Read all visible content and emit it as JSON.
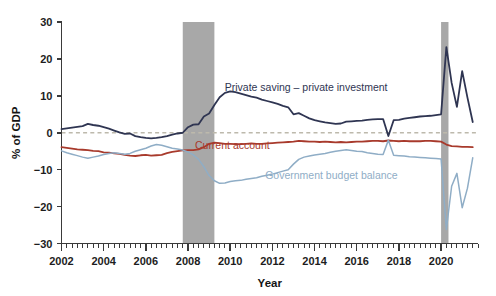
{
  "chart_data": {
    "type": "line",
    "title": "",
    "xlabel": "Year",
    "ylabel": "% of GDP",
    "xlim": [
      2002.0,
      2021.75
    ],
    "ylim": [
      -30,
      30
    ],
    "yticks": [
      -30,
      -20,
      -10,
      0,
      10,
      20,
      30
    ],
    "ytick_labels": [
      "−30",
      "−20",
      "−10",
      "0",
      "10",
      "20",
      "30"
    ],
    "xticks": [
      2002,
      2004,
      2006,
      2008,
      2010,
      2012,
      2014,
      2016,
      2018,
      2020
    ],
    "xtick_labels": [
      "2002",
      "2004",
      "2006",
      "2008",
      "2010",
      "2012",
      "2014",
      "2016",
      "2018",
      "2020"
    ],
    "minor_tick_interval": 0.25,
    "grid": false,
    "legend_position": "inline-annotations",
    "zero_reference_line": {
      "value": 0,
      "style": "dashed",
      "color": "#bdb9ac"
    },
    "shaded_regions": [
      {
        "name": "recession-2008",
        "x_start": 2007.75,
        "x_end": 2009.25,
        "color": "#a8a8a8"
      },
      {
        "name": "recession-2020",
        "x_start": 2020.0,
        "x_end": 2020.35,
        "color": "#a8a8a8"
      }
    ],
    "series": [
      {
        "name": "Private saving – private investment",
        "color": "#2f3552",
        "label_x": 2013.6,
        "label_y": 11.2,
        "x": [
          2002.0,
          2002.25,
          2002.5,
          2002.75,
          2003.0,
          2003.25,
          2003.5,
          2003.75,
          2004.0,
          2004.25,
          2004.5,
          2004.75,
          2005.0,
          2005.25,
          2005.5,
          2005.75,
          2006.0,
          2006.25,
          2006.5,
          2006.75,
          2007.0,
          2007.25,
          2007.5,
          2007.75,
          2008.0,
          2008.25,
          2008.5,
          2008.75,
          2009.0,
          2009.25,
          2009.5,
          2009.75,
          2010.0,
          2010.25,
          2010.5,
          2010.75,
          2011.0,
          2011.25,
          2011.5,
          2011.75,
          2012.0,
          2012.25,
          2012.5,
          2012.75,
          2013.0,
          2013.25,
          2013.5,
          2013.75,
          2014.0,
          2014.25,
          2014.5,
          2014.75,
          2015.0,
          2015.25,
          2015.5,
          2015.75,
          2016.0,
          2016.25,
          2016.5,
          2016.75,
          2017.0,
          2017.25,
          2017.5,
          2017.75,
          2018.0,
          2018.25,
          2018.5,
          2018.75,
          2019.0,
          2019.25,
          2019.5,
          2019.75,
          2020.0,
          2020.25,
          2020.5,
          2020.75,
          2021.0,
          2021.25,
          2021.5
        ],
        "y": [
          1.0,
          1.2,
          1.4,
          1.6,
          1.8,
          2.4,
          2.1,
          1.9,
          1.5,
          1.1,
          0.6,
          0.1,
          -0.3,
          -0.2,
          -0.9,
          -1.2,
          -1.4,
          -1.5,
          -1.4,
          -1.2,
          -0.9,
          -0.5,
          -0.2,
          0.0,
          1.5,
          2.2,
          2.3,
          4.4,
          5.2,
          7.5,
          9.6,
          10.8,
          11.2,
          11.0,
          10.6,
          10.2,
          9.8,
          9.5,
          9.0,
          8.6,
          8.2,
          7.8,
          7.3,
          6.9,
          5.0,
          5.3,
          4.6,
          3.9,
          3.4,
          3.1,
          2.8,
          2.6,
          2.4,
          2.5,
          3.0,
          3.1,
          3.2,
          3.3,
          3.5,
          3.6,
          3.7,
          3.7,
          -0.9,
          3.4,
          3.5,
          3.8,
          4.0,
          4.2,
          4.4,
          4.5,
          4.6,
          4.8,
          5.0,
          23.2,
          13.5,
          7.0,
          16.7,
          9.5,
          2.9
        ]
      },
      {
        "name": "Current account",
        "color": "#a83a2c",
        "label_x": 2010.1,
        "label_y": -4.5,
        "x": [
          2002.0,
          2002.25,
          2002.5,
          2002.75,
          2003.0,
          2003.25,
          2003.5,
          2003.75,
          2004.0,
          2004.25,
          2004.5,
          2004.75,
          2005.0,
          2005.25,
          2005.5,
          2005.75,
          2006.0,
          2006.25,
          2006.5,
          2006.75,
          2007.0,
          2007.25,
          2007.5,
          2007.75,
          2008.0,
          2008.25,
          2008.5,
          2008.75,
          2009.0,
          2009.25,
          2009.5,
          2009.75,
          2010.0,
          2010.25,
          2010.5,
          2010.75,
          2011.0,
          2011.25,
          2011.5,
          2011.75,
          2012.0,
          2012.25,
          2012.5,
          2012.75,
          2013.0,
          2013.25,
          2013.5,
          2013.75,
          2014.0,
          2014.25,
          2014.5,
          2014.75,
          2015.0,
          2015.25,
          2015.5,
          2015.75,
          2016.0,
          2016.25,
          2016.5,
          2016.75,
          2017.0,
          2017.25,
          2017.5,
          2017.75,
          2018.0,
          2018.25,
          2018.5,
          2018.75,
          2019.0,
          2019.25,
          2019.5,
          2019.75,
          2020.0,
          2020.25,
          2020.5,
          2020.75,
          2021.0,
          2021.25,
          2021.5
        ],
        "y": [
          -3.9,
          -4.1,
          -4.3,
          -4.5,
          -4.6,
          -4.7,
          -4.9,
          -5.0,
          -5.3,
          -5.4,
          -5.6,
          -5.7,
          -6.0,
          -6.2,
          -6.3,
          -6.1,
          -6.0,
          -6.2,
          -6.1,
          -6.0,
          -5.5,
          -5.2,
          -5.0,
          -4.8,
          -4.7,
          -4.7,
          -4.5,
          -3.9,
          -3.0,
          -2.7,
          -2.8,
          -3.0,
          -3.0,
          -3.1,
          -3.1,
          -3.0,
          -2.9,
          -3.0,
          -3.0,
          -2.9,
          -2.8,
          -2.7,
          -2.6,
          -2.5,
          -2.4,
          -2.2,
          -2.3,
          -2.4,
          -2.4,
          -2.5,
          -2.4,
          -2.5,
          -2.6,
          -2.5,
          -2.6,
          -2.5,
          -2.4,
          -2.4,
          -2.3,
          -2.2,
          -2.2,
          -2.3,
          -2.1,
          -2.2,
          -2.3,
          -2.2,
          -2.3,
          -2.3,
          -2.3,
          -2.2,
          -2.2,
          -2.3,
          -2.4,
          -3.2,
          -3.6,
          -3.7,
          -3.8,
          -3.8,
          -3.9
        ]
      },
      {
        "name": "Government budget balance",
        "color": "#8fadc6",
        "label_x": 2014.8,
        "label_y": -12.4,
        "x": [
          2002.0,
          2002.25,
          2002.5,
          2002.75,
          2003.0,
          2003.25,
          2003.5,
          2003.75,
          2004.0,
          2004.25,
          2004.5,
          2004.75,
          2005.0,
          2005.25,
          2005.5,
          2005.75,
          2006.0,
          2006.25,
          2006.5,
          2006.75,
          2007.0,
          2007.25,
          2007.5,
          2007.75,
          2008.0,
          2008.25,
          2008.5,
          2008.75,
          2009.0,
          2009.25,
          2009.5,
          2009.75,
          2010.0,
          2010.25,
          2010.5,
          2010.75,
          2011.0,
          2011.25,
          2011.5,
          2011.75,
          2012.0,
          2012.25,
          2012.5,
          2012.75,
          2013.0,
          2013.25,
          2013.5,
          2013.75,
          2014.0,
          2014.25,
          2014.5,
          2014.75,
          2015.0,
          2015.25,
          2015.5,
          2015.75,
          2016.0,
          2016.25,
          2016.5,
          2016.75,
          2017.0,
          2017.25,
          2017.5,
          2017.75,
          2018.0,
          2018.25,
          2018.5,
          2018.75,
          2019.0,
          2019.25,
          2019.5,
          2019.75,
          2020.0,
          2020.25,
          2020.5,
          2020.75,
          2021.0,
          2021.25,
          2021.5
        ],
        "y": [
          -4.9,
          -5.4,
          -5.8,
          -6.2,
          -6.6,
          -6.9,
          -6.6,
          -6.3,
          -5.9,
          -5.6,
          -5.4,
          -5.6,
          -5.8,
          -5.6,
          -5.0,
          -4.6,
          -4.2,
          -3.6,
          -3.2,
          -3.4,
          -3.8,
          -4.2,
          -4.4,
          -4.7,
          -5.2,
          -6.0,
          -7.2,
          -9.2,
          -11.6,
          -13.0,
          -13.7,
          -13.6,
          -13.2,
          -13.0,
          -12.9,
          -12.6,
          -12.4,
          -12.2,
          -11.8,
          -11.5,
          -11.2,
          -10.8,
          -10.4,
          -10.0,
          -8.5,
          -7.2,
          -6.6,
          -6.3,
          -6.0,
          -5.8,
          -5.6,
          -5.3,
          -5.0,
          -4.8,
          -4.6,
          -4.8,
          -5.0,
          -5.1,
          -5.4,
          -5.6,
          -5.8,
          -5.9,
          -2.0,
          -6.1,
          -6.2,
          -6.3,
          -6.5,
          -6.6,
          -6.7,
          -6.8,
          -6.9,
          -7.0,
          -7.1,
          -26.2,
          -14.5,
          -11.0,
          -20.3,
          -15.0,
          -6.8
        ]
      }
    ]
  },
  "axis": {
    "ylabel": "% of GDP",
    "xlabel": "Year"
  }
}
